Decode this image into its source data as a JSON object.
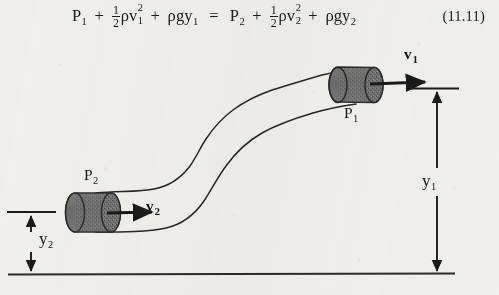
{
  "figure": {
    "caption_number": "(11.11)",
    "background_color": "#f1f0ec",
    "ink_color": "#1a1a1a",
    "cylinder_fill": "#6f6f6f"
  },
  "equation": {
    "lhs": {
      "p_symbol": "P",
      "p_subscript": "1",
      "plus_1": "+",
      "half_numerator": "1",
      "half_denominator": "2",
      "rho": "ρ",
      "v_symbol": "v",
      "v_superscript": "2",
      "v_subscript": "1",
      "plus_2": "+",
      "rho_g_y": "ρgy",
      "y_subscript": "1"
    },
    "equals": "=",
    "rhs": {
      "p_symbol": "P",
      "p_subscript": "2",
      "plus_1": "+",
      "half_numerator": "1",
      "half_denominator": "2",
      "rho": "ρ",
      "v_symbol": "v",
      "v_superscript": "2",
      "v_subscript": "2",
      "plus_2": "+",
      "rho_g_y": "ρgy",
      "y_subscript": "2"
    },
    "number": "(11.11)"
  },
  "diagram": {
    "pressure_upper": {
      "symbol": "P",
      "subscript": "1"
    },
    "pressure_lower": {
      "symbol": "P",
      "subscript": "2"
    },
    "velocity_upper": {
      "symbol": "v",
      "subscript": "1"
    },
    "velocity_lower": {
      "symbol": "v",
      "subscript": "2"
    },
    "height_upper": {
      "symbol": "y",
      "subscript": "1"
    },
    "height_lower": {
      "symbol": "y",
      "subscript": "2"
    }
  }
}
